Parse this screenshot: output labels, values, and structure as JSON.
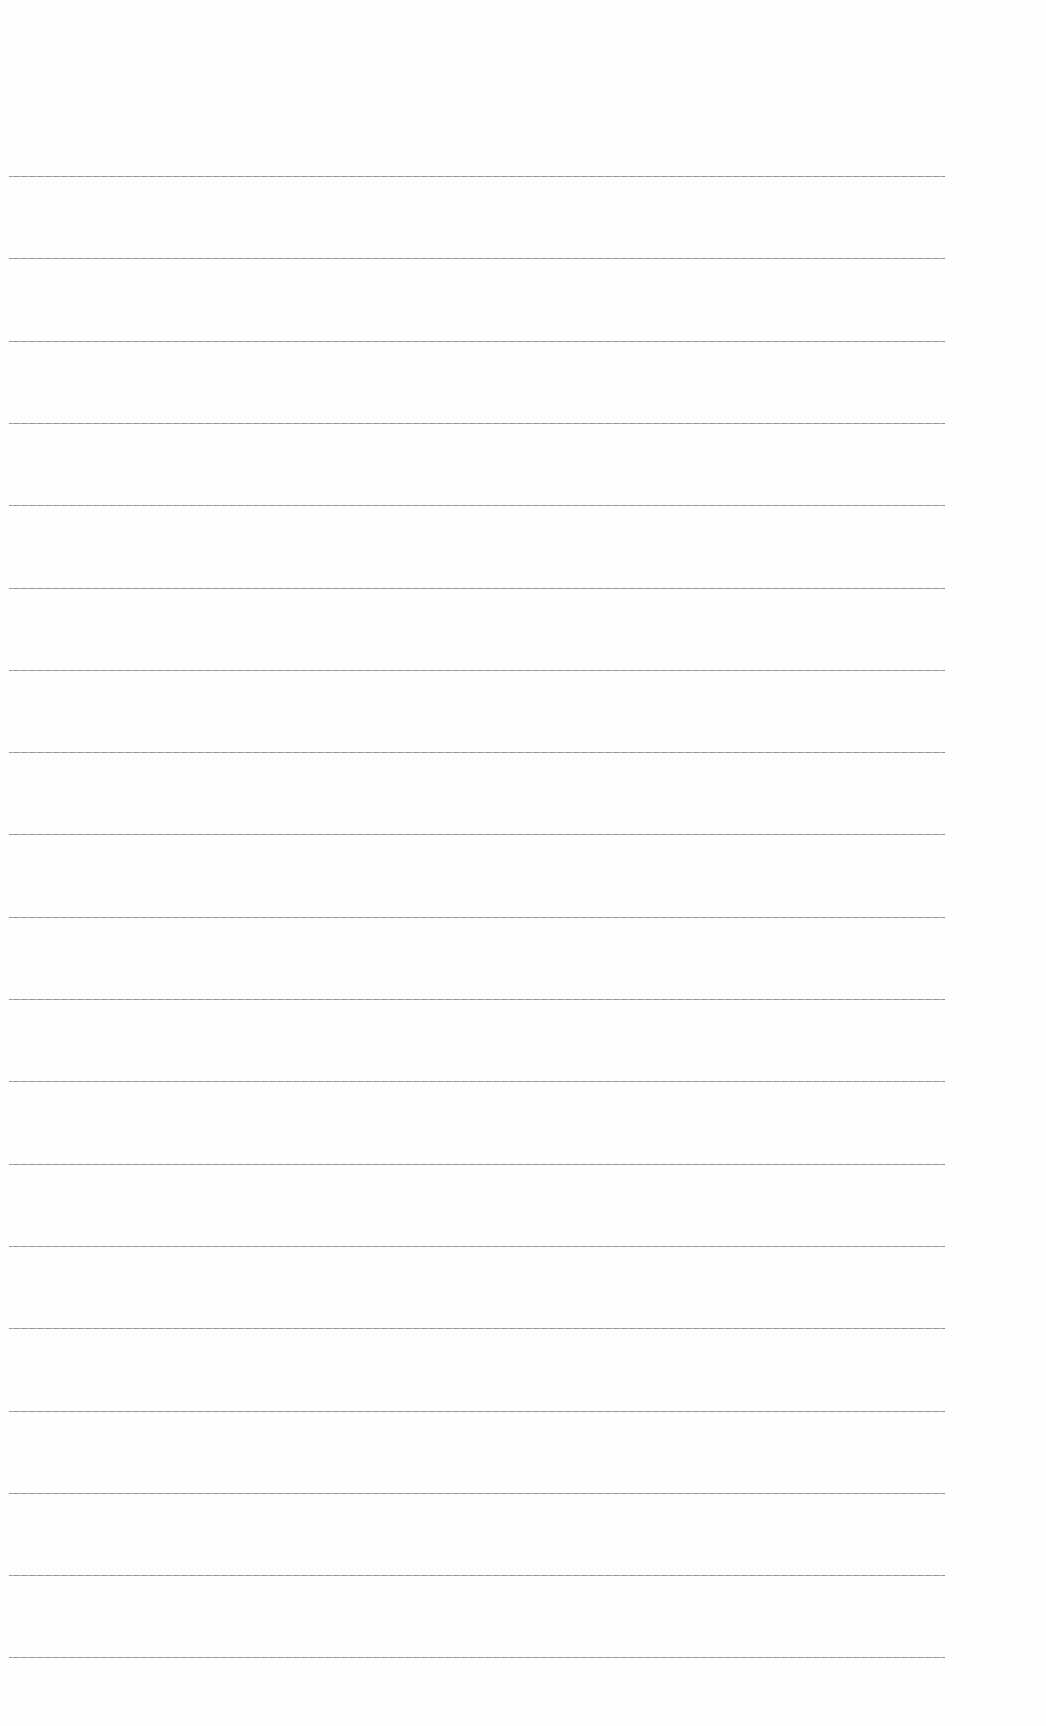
{
  "page": {
    "type": "lined-paper",
    "background_color": "#fefefe",
    "line_color": "#8a8a8a",
    "line_count": 19,
    "line_left": 9,
    "line_right": 945,
    "first_line_y": 176,
    "line_spacing": 82.3
  }
}
